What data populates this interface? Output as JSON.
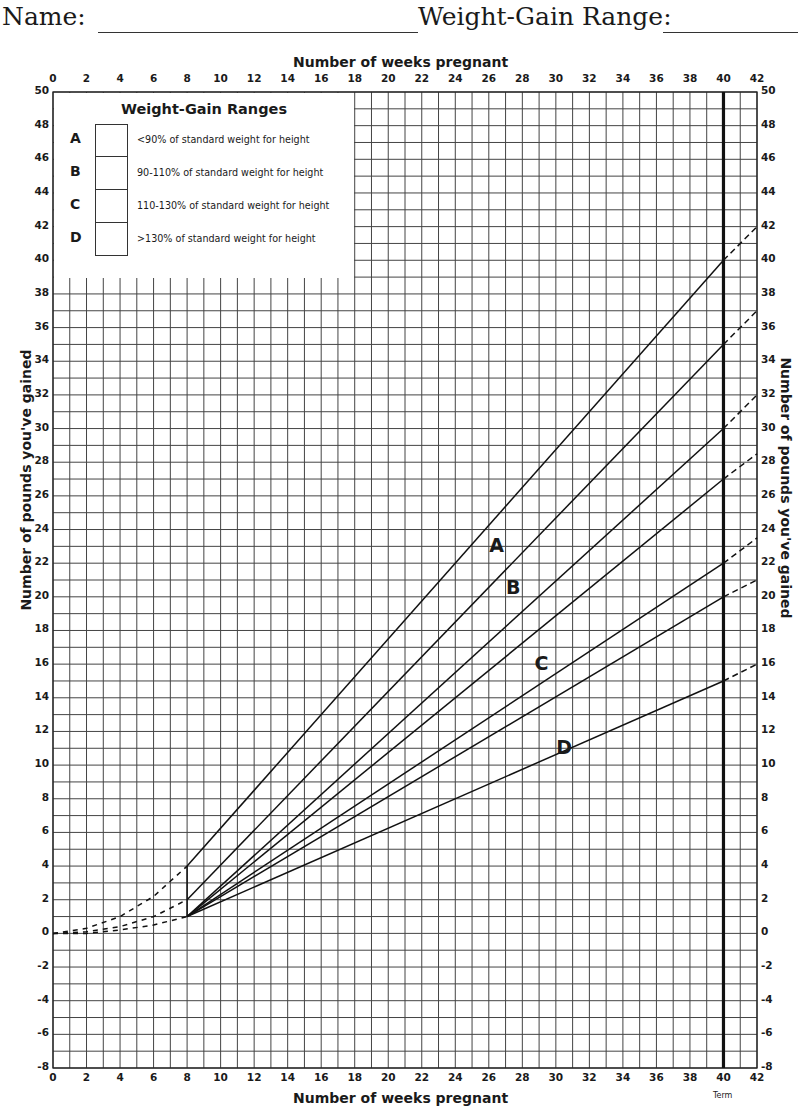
{
  "header": {
    "name_label": "Name:",
    "range_label": "Weight-Gain Range:"
  },
  "legend": {
    "title": "Weight-Gain Ranges",
    "items": [
      {
        "letter": "A",
        "text": "<90% of standard weight for height"
      },
      {
        "letter": "B",
        "text": "90-110% of standard weight for height"
      },
      {
        "letter": "C",
        "text": "110-130% of standard weight for height"
      },
      {
        "letter": "D",
        "text": ">130% of standard weight for height"
      }
    ]
  },
  "axes": {
    "x_title_top": "Number of weeks pregnant",
    "x_title_bottom": "Number of weeks pregnant",
    "y_title_left": "Number of pounds you've gained",
    "y_title_right": "Number of pounds you've gained",
    "term_label": "Term"
  },
  "curve_labels": {
    "A": "A",
    "B": "B",
    "C": "C",
    "D": "D"
  },
  "chart_data": {
    "type": "line",
    "title": "",
    "xlabel": "Number of weeks pregnant",
    "ylabel": "Number of pounds you've gained",
    "xlim": [
      0,
      42
    ],
    "ylim": [
      -8,
      50
    ],
    "x_ticks": [
      0,
      2,
      4,
      6,
      8,
      10,
      12,
      14,
      16,
      18,
      20,
      22,
      24,
      26,
      28,
      30,
      32,
      34,
      36,
      38,
      40,
      42
    ],
    "y_ticks": [
      -8,
      -6,
      -4,
      -2,
      0,
      2,
      4,
      6,
      8,
      10,
      12,
      14,
      16,
      18,
      20,
      22,
      24,
      26,
      28,
      30,
      32,
      34,
      36,
      38,
      40,
      42,
      44,
      46,
      48,
      50
    ],
    "grid": true,
    "grid_minor_x": 1,
    "grid_minor_y": 1,
    "term_week": 40,
    "series": [
      {
        "name": "A upper",
        "points": [
          [
            8,
            4
          ],
          [
            40,
            40
          ]
        ],
        "extension": [
          [
            40,
            40
          ],
          [
            42,
            42
          ]
        ]
      },
      {
        "name": "A lower / B upper",
        "points": [
          [
            8,
            2
          ],
          [
            40,
            35
          ]
        ],
        "extension": [
          [
            40,
            35
          ],
          [
            42,
            37
          ]
        ]
      },
      {
        "name": "B lower",
        "points": [
          [
            8,
            1
          ],
          [
            40,
            30
          ]
        ],
        "extension": [
          [
            40,
            30
          ],
          [
            42,
            32
          ]
        ]
      },
      {
        "name": "C upper",
        "points": [
          [
            8,
            1
          ],
          [
            40,
            27
          ]
        ],
        "extension": [
          [
            40,
            27
          ],
          [
            42,
            28.5
          ]
        ]
      },
      {
        "name": "C lower",
        "points": [
          [
            8,
            1
          ],
          [
            40,
            22
          ]
        ],
        "extension": [
          [
            40,
            22
          ],
          [
            42,
            23.5
          ]
        ]
      },
      {
        "name": "D upper",
        "points": [
          [
            8,
            1
          ],
          [
            40,
            20
          ]
        ],
        "extension": [
          [
            40,
            20
          ],
          [
            42,
            21
          ]
        ]
      },
      {
        "name": "D lower",
        "points": [
          [
            8,
            1
          ],
          [
            40,
            15
          ]
        ],
        "extension": [
          [
            40,
            15
          ],
          [
            42,
            16
          ]
        ]
      }
    ],
    "early_dashed_curves": [
      {
        "name": "early upper",
        "points": [
          [
            0,
            0
          ],
          [
            2,
            0.3
          ],
          [
            4,
            1
          ],
          [
            6,
            2.2
          ],
          [
            8,
            4
          ]
        ]
      },
      {
        "name": "early middle",
        "points": [
          [
            0,
            0
          ],
          [
            2,
            0.1
          ],
          [
            4,
            0.4
          ],
          [
            6,
            1
          ],
          [
            8,
            2
          ]
        ]
      },
      {
        "name": "early lower",
        "points": [
          [
            0,
            0
          ],
          [
            2,
            0
          ],
          [
            4,
            0.2
          ],
          [
            6,
            0.5
          ],
          [
            8,
            1
          ]
        ]
      }
    ],
    "region_labels": [
      {
        "label": "A",
        "x": 26.5,
        "y": 23
      },
      {
        "label": "B",
        "x": 27.5,
        "y": 20.5
      },
      {
        "label": "C",
        "x": 29.2,
        "y": 16
      },
      {
        "label": "D",
        "x": 30.5,
        "y": 11
      }
    ]
  }
}
